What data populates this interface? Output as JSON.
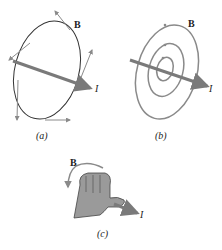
{
  "figure": {
    "panel_a": {
      "caption": "(a)",
      "field_label": "B",
      "current_label": "I"
    },
    "panel_b": {
      "caption": "(b)",
      "field_label": "B",
      "current_label": "I"
    },
    "panel_c": {
      "caption": "(c)",
      "field_label": "B",
      "current_label": "I"
    }
  },
  "colors": {
    "current_arrow": "#7a7a7a",
    "field_lines_a": "#333333",
    "field_lines_b": "#8a8a8a",
    "tangent_arrows": "#8a8a8a",
    "hand_fill": "#9a9a9a",
    "hand_outline": "#444444"
  }
}
